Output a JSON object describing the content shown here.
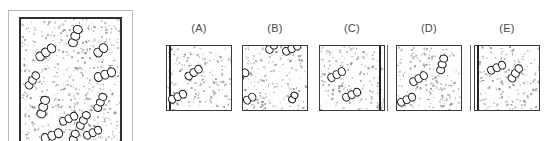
{
  "figure": {
    "title": "",
    "kind": "multiple-choice-micrograph-comparison",
    "background_color": "#ffffff",
    "ink_color": "#141414",
    "speckle_color": "#8e8e8e",
    "border_color": "#3a3a3a"
  },
  "main_panel": {
    "label": "",
    "description": "Large reference micrograph field with speckled background and chained cocci clusters distributed throughout the interior",
    "border_style": "double",
    "outer_border_color": "#b9b9b9",
    "inner_border_color": "#2f2f2f",
    "cluster_count": 12,
    "clusters": [
      {
        "x": 55,
        "y": 14,
        "rot": -70,
        "n": 3,
        "size": "lg"
      },
      {
        "x": 24,
        "y": 27,
        "rot": -35,
        "n": 3,
        "size": "lg"
      },
      {
        "x": 80,
        "y": 25,
        "rot": -40,
        "n": 2,
        "size": "lg"
      },
      {
        "x": 11,
        "y": 49,
        "rot": -55,
        "n": 3,
        "size": "md"
      },
      {
        "x": 84,
        "y": 44,
        "rot": -20,
        "n": 3,
        "size": "lg"
      },
      {
        "x": 22,
        "y": 70,
        "rot": -75,
        "n": 3,
        "size": "lg"
      },
      {
        "x": 80,
        "y": 66,
        "rot": -65,
        "n": 3,
        "size": "md"
      },
      {
        "x": 47,
        "y": 79,
        "rot": -25,
        "n": 3,
        "size": "md"
      },
      {
        "x": 63,
        "y": 80,
        "rot": -60,
        "n": 3,
        "size": "md"
      },
      {
        "x": 30,
        "y": 92,
        "rot": -20,
        "n": 3,
        "size": "lg"
      },
      {
        "x": 53,
        "y": 95,
        "rot": -70,
        "n": 3,
        "size": "md"
      },
      {
        "x": 72,
        "y": 90,
        "rot": -25,
        "n": 3,
        "size": "md"
      }
    ]
  },
  "options": [
    {
      "id": "A",
      "label": "(A)",
      "left": 160,
      "edge_bar": "left",
      "outer_rule": null,
      "clusters": [
        {
          "x": 40,
          "y": 42,
          "rot": -35,
          "n": 3,
          "size": "md"
        },
        {
          "x": 16,
          "y": 80,
          "rot": -25,
          "n": 3,
          "size": "md"
        }
      ]
    },
    {
      "id": "B",
      "label": "(B)",
      "left": 236,
      "edge_bar": null,
      "outer_rule": null,
      "clusters": [
        {
          "x": 44,
          "y": 3,
          "rot": -45,
          "n": 2,
          "size": "md"
        },
        {
          "x": 75,
          "y": 5,
          "rot": -25,
          "n": 3,
          "size": "md"
        },
        {
          "x": -2,
          "y": 45,
          "rot": -35,
          "n": 2,
          "size": "md"
        },
        {
          "x": 10,
          "y": 83,
          "rot": -30,
          "n": 2,
          "size": "md"
        },
        {
          "x": 78,
          "y": 82,
          "rot": -60,
          "n": 2,
          "size": "sm"
        }
      ]
    },
    {
      "id": "C",
      "label": "(C)",
      "left": 313,
      "edge_bar": "right",
      "outer_rule": "right",
      "clusters": [
        {
          "x": 25,
          "y": 46,
          "rot": -30,
          "n": 3,
          "size": "md"
        },
        {
          "x": 48,
          "y": 76,
          "rot": -25,
          "n": 3,
          "size": "md"
        }
      ]
    },
    {
      "id": "D",
      "label": "(D)",
      "left": 390,
      "edge_bar": null,
      "outer_rule": null,
      "clusters": [
        {
          "x": 70,
          "y": 30,
          "rot": -75,
          "n": 3,
          "size": "md"
        },
        {
          "x": 33,
          "y": 52,
          "rot": -30,
          "n": 3,
          "size": "md"
        },
        {
          "x": 14,
          "y": 84,
          "rot": -25,
          "n": 3,
          "size": "md"
        }
      ]
    },
    {
      "id": "E",
      "label": "(E)",
      "left": 468,
      "edge_bar": "left",
      "outer_rule": "left",
      "clusters": [
        {
          "x": 33,
          "y": 34,
          "rot": -25,
          "n": 3,
          "size": "md"
        },
        {
          "x": 62,
          "y": 44,
          "rot": -55,
          "n": 3,
          "size": "md"
        }
      ]
    }
  ]
}
